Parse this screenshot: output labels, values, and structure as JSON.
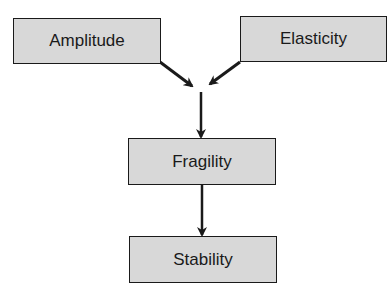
{
  "diagram": {
    "nodes": [
      {
        "id": "amplitude",
        "label": "Amplitude"
      },
      {
        "id": "elasticity",
        "label": "Elasticity"
      },
      {
        "id": "fragility",
        "label": "Fragility"
      },
      {
        "id": "stability",
        "label": "Stability"
      }
    ],
    "edges": [
      {
        "from": "amplitude",
        "to": "fragility"
      },
      {
        "from": "elasticity",
        "to": "fragility"
      },
      {
        "from": "fragility",
        "to": "stability"
      }
    ],
    "colors": {
      "box_fill": "#d8d8d8",
      "border": "#1a1a1a",
      "arrow": "#1a1a1a"
    }
  }
}
